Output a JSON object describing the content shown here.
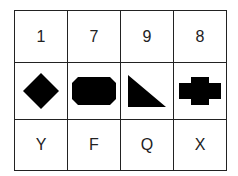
{
  "table": {
    "numbers": [
      "1",
      "7",
      "9",
      "8"
    ],
    "shapes": [
      "diamond-icon",
      "octagon-rectangle-icon",
      "right-triangle-icon",
      "cross-icon"
    ],
    "letters": [
      "Y",
      "F",
      "Q",
      "X"
    ]
  },
  "colors": {
    "line": "#222222",
    "shape_fill": "#000000",
    "background": "#ffffff"
  }
}
